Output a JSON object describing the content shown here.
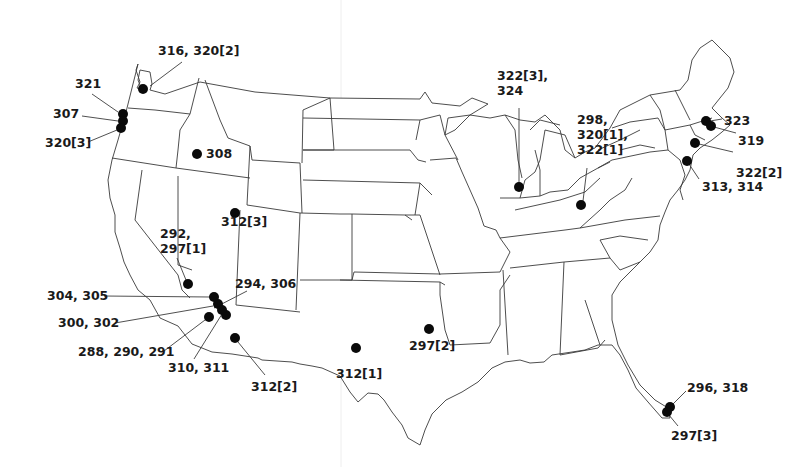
{
  "map": {
    "title": "",
    "background": "#ffffff",
    "marker_color": "#0a0a0a",
    "border_color": "#3a3a3a",
    "labels": [
      {
        "id": "wa",
        "lines": [
          "316, 320[2]"
        ],
        "x": 158,
        "y": 55,
        "dot": [
          143,
          89
        ],
        "leader": [
          [
            150,
            86
          ],
          [
            182,
            62
          ]
        ]
      },
      {
        "id": "or-321",
        "lines": [
          "321"
        ],
        "x": 75,
        "y": 88,
        "dot": [
          123,
          114
        ],
        "leader": [
          [
            92,
            94
          ],
          [
            118,
            112
          ]
        ]
      },
      {
        "id": "or-307",
        "lines": [
          "307"
        ],
        "x": 53,
        "y": 118,
        "dot": [
          123,
          121
        ],
        "leader": [
          [
            82,
            116
          ],
          [
            118,
            121
          ]
        ]
      },
      {
        "id": "or-320-3",
        "lines": [
          "320[3]"
        ],
        "x": 45,
        "y": 147,
        "dot": [
          121,
          128
        ],
        "leader": [
          [
            88,
            142
          ],
          [
            117,
            130
          ]
        ]
      },
      {
        "id": "id-308",
        "lines": [
          "308"
        ],
        "x": 206,
        "y": 158,
        "dot": [
          197,
          154
        ],
        "leader": null
      },
      {
        "id": "ut-312-3",
        "lines": [
          "312[3]"
        ],
        "x": 221,
        "y": 226,
        "dot": [
          235,
          213
        ],
        "leader": null
      },
      {
        "id": "nv-292",
        "lines": [
          "292,",
          "297[1]"
        ],
        "x": 160,
        "y": 238,
        "dot": [
          188,
          284
        ],
        "leader": [
          [
            177,
            258
          ],
          [
            186,
            280
          ]
        ]
      },
      {
        "id": "az-294",
        "lines": [
          "294, 306"
        ],
        "x": 235,
        "y": 288,
        "dot": [
          226,
          315
        ],
        "leader": [
          [
            247,
            291
          ],
          [
            214,
            308
          ]
        ]
      },
      {
        "id": "ca-304",
        "lines": [
          "304, 305"
        ],
        "x": 47,
        "y": 300,
        "dot": [
          214,
          297
        ],
        "leader": [
          [
            104,
            296
          ],
          [
            210,
            297
          ]
        ]
      },
      {
        "id": "ca-300",
        "lines": [
          "300, 302"
        ],
        "x": 58,
        "y": 327,
        "dot": [
          218,
          304
        ],
        "leader": [
          [
            115,
            323
          ],
          [
            213,
            306
          ]
        ]
      },
      {
        "id": "ca-288",
        "lines": [
          "288, 290, 291"
        ],
        "x": 78,
        "y": 356,
        "dot": [
          209,
          317
        ],
        "leader": [
          [
            164,
            351
          ],
          [
            205,
            320
          ]
        ]
      },
      {
        "id": "az-310",
        "lines": [
          "310, 311"
        ],
        "x": 168,
        "y": 372,
        "dot": [
          222,
          310
        ],
        "leader": [
          [
            194,
            359
          ],
          [
            222,
            314
          ]
        ]
      },
      {
        "id": "az-312-2",
        "lines": [
          "312[2]"
        ],
        "x": 251,
        "y": 391,
        "dot": [
          235,
          338
        ],
        "leader": [
          [
            265,
            375
          ],
          [
            238,
            342
          ]
        ]
      },
      {
        "id": "tx-312-1",
        "lines": [
          "312[1]"
        ],
        "x": 336,
        "y": 378,
        "dot": [
          356,
          348
        ],
        "leader": null
      },
      {
        "id": "tx-297-2",
        "lines": [
          "297[2]"
        ],
        "x": 409,
        "y": 350,
        "dot": [
          429,
          329
        ],
        "leader": null
      },
      {
        "id": "il",
        "lines": [
          "322[3],",
          "324"
        ],
        "x": 497,
        "y": 80,
        "dot": [
          519,
          187
        ],
        "leader": [
          [
            519,
            108
          ],
          [
            519,
            183
          ]
        ]
      },
      {
        "id": "oh",
        "lines": [
          "298,",
          "320[1],",
          "322[1]"
        ],
        "x": 577,
        "y": 124,
        "dot": [
          581,
          205
        ],
        "leader": [
          [
            587,
            168
          ],
          [
            583,
            201
          ]
        ]
      },
      {
        "id": "ma-323",
        "lines": [
          "323"
        ],
        "x": 724,
        "y": 125,
        "dot": [
          706,
          121
        ],
        "leader": [
          [
            722,
            119
          ],
          [
            710,
            121
          ]
        ]
      },
      {
        "id": "ma-319",
        "lines": [
          "319"
        ],
        "x": 738,
        "y": 145,
        "dot": [
          711,
          126
        ],
        "leader": [
          [
            736,
            133
          ],
          [
            714,
            127
          ]
        ]
      },
      {
        "id": "ct",
        "lines": [
          "322[2]"
        ],
        "x": 736,
        "y": 177,
        "dot": [
          695,
          143
        ],
        "leader": [
          [
            733,
            152
          ],
          [
            699,
            144
          ]
        ]
      },
      {
        "id": "nj",
        "lines": [
          "313, 314"
        ],
        "x": 702,
        "y": 191,
        "dot": [
          687,
          161
        ],
        "leader": [
          [
            699,
            179
          ],
          [
            689,
            164
          ]
        ]
      },
      {
        "id": "fl-296",
        "lines": [
          "296, 318"
        ],
        "x": 687,
        "y": 392,
        "dot": [
          670,
          407
        ],
        "leader": [
          [
            686,
            391
          ],
          [
            673,
            404
          ]
        ]
      },
      {
        "id": "fl-297-3",
        "lines": [
          "297[3]"
        ],
        "x": 671,
        "y": 440,
        "dot": [
          667,
          412
        ],
        "leader": [
          [
            678,
            426
          ],
          [
            669,
            415
          ]
        ]
      }
    ]
  }
}
